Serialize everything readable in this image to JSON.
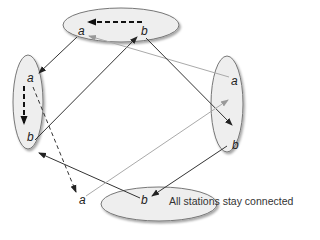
{
  "caption": "All stations stay connected",
  "colors": {
    "ellipse_fill": "#eeeeee",
    "ellipse_stroke": "#777777",
    "edge_dark": "#333333",
    "edge_light": "#aaaaaa"
  },
  "stations": [
    {
      "id": "top",
      "labels": [
        "a",
        "b"
      ],
      "internal_edge": "b→a (dashed)"
    },
    {
      "id": "left",
      "labels": [
        "a",
        "b"
      ],
      "internal_edge": "a→b (dashed)"
    },
    {
      "id": "right",
      "labels": [
        "a",
        "b"
      ],
      "internal_edge": "none"
    },
    {
      "id": "bottom",
      "labels": [
        "a",
        "b"
      ],
      "internal_edge": "none"
    }
  ],
  "edges": [
    {
      "from": "top.a",
      "to": "left.a",
      "style": "solid"
    },
    {
      "from": "left.b",
      "to": "top.b",
      "style": "solid"
    },
    {
      "from": "right.a",
      "to": "top.a",
      "style": "light"
    },
    {
      "from": "top.b",
      "to": "right.b",
      "style": "solid"
    },
    {
      "from": "left.a",
      "to": "bottom.a",
      "style": "dashed"
    },
    {
      "from": "bottom.b",
      "to": "left.b",
      "style": "solid"
    },
    {
      "from": "bottom.a",
      "to": "right.a",
      "style": "light"
    },
    {
      "from": "right.b",
      "to": "bottom.b",
      "style": "solid"
    }
  ],
  "labels": {
    "top_a": "a",
    "top_b": "b",
    "left_a": "a",
    "left_b": "b",
    "right_a": "a",
    "right_b": "b",
    "bottom_a": "a",
    "bottom_b": "b"
  }
}
